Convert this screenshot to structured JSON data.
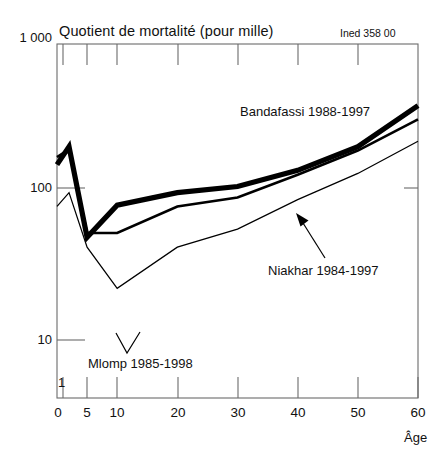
{
  "figure": {
    "title": "Quotient de mortalité (pour mille)",
    "credit": "Ined 358 00",
    "xlabel": "Âge",
    "ylabel": ""
  },
  "axes": {
    "y_ticks": [
      "1 000",
      "100",
      "10",
      "1"
    ],
    "x_ticks": [
      "0",
      "5",
      "10",
      "20",
      "30",
      "40",
      "50",
      "60"
    ]
  },
  "series_labels": {
    "bandafassi": "Bandafassi 1988-1997",
    "niakhar": "Niakhar 1984-1997",
    "mlomp": "Mlomp 1985-1998"
  },
  "colors": {
    "line": "#000000",
    "axis": "#6b6b6b",
    "background": "#ffffff"
  },
  "chart_data": {
    "type": "line",
    "title": "Quotient de mortalité (pour mille)",
    "xlabel": "Âge",
    "ylabel": "Quotient de mortalité (pour mille)",
    "yscale": "log",
    "ylim": [
      1,
      1000
    ],
    "xlim": [
      0,
      60
    ],
    "grid": false,
    "legend": "annotations-on-plot",
    "ytick_values": [
      1,
      10,
      100,
      1000
    ],
    "ytick_labels": [
      "1",
      "10",
      "100",
      "1 000"
    ],
    "xtick_values": [
      0,
      5,
      10,
      20,
      30,
      40,
      50,
      60
    ],
    "xtick_labels": [
      "0",
      "5",
      "10",
      "20",
      "30",
      "40",
      "50",
      "60"
    ],
    "annotations": [
      {
        "text": "Bandafassi 1988-1997",
        "x": 33,
        "y": 330
      },
      {
        "text": "Niakhar 1984-1997",
        "x": 42,
        "y": 26,
        "arrow_to": {
          "x": 39,
          "y": 80
        }
      },
      {
        "text": "Mlomp 1985-1998",
        "x": 13,
        "y": 3.4
      }
    ],
    "series": [
      {
        "name": "Bandafassi 1988-1997",
        "linewidth": "thick",
        "x": [
          0,
          2,
          5,
          10,
          20,
          30,
          40,
          50,
          60
        ],
        "values": [
          95,
          135,
          23,
          43,
          55,
          62,
          85,
          135,
          300
        ]
      },
      {
        "name": "Niakhar 1984-1997",
        "linewidth": "medium",
        "x": [
          0,
          2,
          5,
          10,
          20,
          30,
          40,
          50,
          60
        ],
        "values": [
          110,
          128,
          25,
          25,
          42,
          50,
          78,
          125,
          230
        ]
      },
      {
        "name": "Mlomp 1985-1998",
        "linewidth": "thin",
        "x": [
          0,
          2,
          5,
          10,
          20,
          30,
          40,
          50,
          60
        ],
        "values": [
          42,
          55,
          19,
          8.5,
          19,
          27,
          48,
          80,
          150
        ]
      }
    ]
  }
}
